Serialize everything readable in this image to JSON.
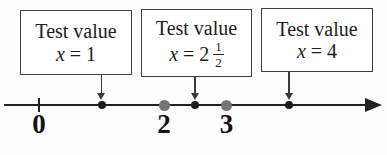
{
  "boxes": [
    {
      "title": "Test value",
      "variable": "x",
      "relation": "=",
      "value_display": "1",
      "value": 1
    },
    {
      "title": "Test value",
      "variable": "x",
      "relation": "=",
      "whole": "2",
      "frac_num": "1",
      "frac_den": "2",
      "value": 2.5
    },
    {
      "title": "Test value",
      "variable": "x",
      "relation": "=",
      "value_display": "4",
      "value": 4
    }
  ],
  "numberline": {
    "ticks": [
      0
    ],
    "tick_labels": [
      {
        "value": 0,
        "label": "0"
      },
      {
        "value": 2,
        "label": "2"
      },
      {
        "value": 3,
        "label": "3"
      }
    ],
    "points": [
      {
        "value": 1,
        "kind": "test"
      },
      {
        "value": 2,
        "kind": "boundary"
      },
      {
        "value": 2.5,
        "kind": "test"
      },
      {
        "value": 3,
        "kind": "boundary"
      },
      {
        "value": 4,
        "kind": "test"
      }
    ],
    "arrow_values": [
      1,
      2.5,
      4
    ]
  },
  "colors": {
    "ink": "#1c1c1c",
    "line": "#222222",
    "box_border": "#3f3f3f",
    "boundary_dot": "#757575",
    "background": "#fdfdfd"
  }
}
